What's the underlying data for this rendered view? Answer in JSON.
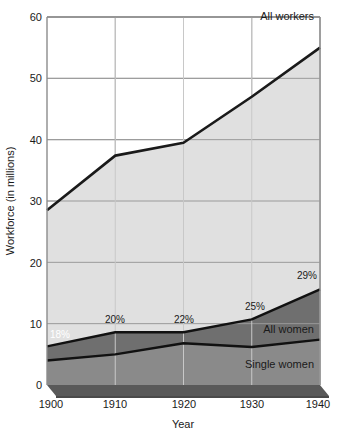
{
  "chart_data": {
    "type": "area",
    "title": "",
    "subtitle": "",
    "xlabel": "Year",
    "ylabel": "Workforce (in millions)",
    "x": [
      1900,
      1910,
      1920,
      1930,
      1940
    ],
    "categories": [
      "1900",
      "1910",
      "1920",
      "1930",
      "1940"
    ],
    "xlim": [
      1900,
      1940
    ],
    "ylim": [
      0,
      60
    ],
    "yticks": [
      0,
      10,
      20,
      30,
      40,
      50,
      60
    ],
    "ytick_labels": [
      "0",
      "10",
      "20",
      "30",
      "40",
      "50",
      "60"
    ],
    "xticks": [
      1900,
      1910,
      1920,
      1930,
      1940
    ],
    "xtick_labels": [
      "1900",
      "1910",
      "1920",
      "1930",
      "1940"
    ],
    "grid": true,
    "legend_position": "inline-annotations",
    "series": [
      {
        "name": "All workers",
        "label": "All workers",
        "values": [
          28.5,
          37.4,
          39.5,
          47.0,
          55.0
        ],
        "color": "#e0e0e0",
        "line_color": "#222222"
      },
      {
        "name": "All women",
        "label": "All women",
        "values": [
          6.3,
          8.6,
          8.6,
          10.7,
          15.6
        ],
        "color": "#6f6f6f",
        "line_color": "#111111"
      },
      {
        "name": "Single women",
        "label": "Single women",
        "values": [
          4.0,
          5.0,
          6.8,
          6.2,
          7.4
        ],
        "color": "#8a8a8a",
        "line_color": "#111111"
      }
    ],
    "annotations": [
      {
        "text": "18%",
        "x": 1900,
        "y": 9.3,
        "anchor": "start",
        "style": "light"
      },
      {
        "text": "20%",
        "x": 1910,
        "y": 10.2,
        "anchor": "middle",
        "style": "dark"
      },
      {
        "text": "22%",
        "x": 1920,
        "y": 10.2,
        "anchor": "middle",
        "style": "dark"
      },
      {
        "text": "25%",
        "x": 1930,
        "y": 12.4,
        "anchor": "middle",
        "style": "dark"
      },
      {
        "text": "29%",
        "x": 1940,
        "y": 17.6,
        "anchor": "end",
        "style": "dark"
      }
    ]
  },
  "axes": {
    "y_title": "Workforce (in millions)",
    "x_title": "Year",
    "y_tick_0": "0",
    "y_tick_10": "10",
    "y_tick_20": "20",
    "y_tick_30": "30",
    "y_tick_40": "40",
    "y_tick_50": "50",
    "y_tick_60": "60",
    "x_tick_1900": "1900",
    "x_tick_1910": "1910",
    "x_tick_1920": "1920",
    "x_tick_1930": "1930",
    "x_tick_1940": "1940"
  },
  "labels": {
    "all_workers": "All workers",
    "all_women": "All women",
    "single_women": "Single women",
    "pct_1900": "18%",
    "pct_1910": "20%",
    "pct_1920": "22%",
    "pct_1930": "25%",
    "pct_1940": "29%"
  },
  "colors": {
    "background": "#ffffff",
    "all_workers_fill": "#e0e0e0",
    "all_women_fill": "#6f6f6f",
    "single_women_fill": "#8a8a8a",
    "base_strip": "#595959",
    "base_strip_shadow": "#4a4a4a",
    "gridline": "#9a9a9a",
    "line": "#1a1a1a",
    "text": "#1a1a1a"
  }
}
